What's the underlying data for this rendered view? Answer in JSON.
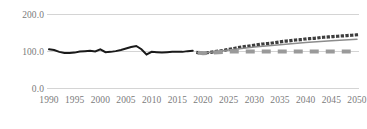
{
  "chart_data": {
    "type": "line",
    "title": "",
    "subtitle": "",
    "xlabel": "",
    "ylabel": "",
    "xlim": [
      1990,
      2050
    ],
    "ylim": [
      0,
      200
    ],
    "grid": true,
    "grid_axis": "y",
    "legend": "none",
    "yticks": [
      "0.0",
      "100.0",
      "200.0"
    ],
    "ytick_values": [
      0,
      100,
      200
    ],
    "xticks": [
      "1990",
      "1995",
      "2000",
      "2005",
      "2010",
      "2015",
      "2020",
      "2025",
      "2030",
      "2035",
      "2040",
      "2045",
      "2050"
    ],
    "xtick_values": [
      1990,
      1995,
      2000,
      2005,
      2010,
      2015,
      2020,
      2025,
      2030,
      2035,
      2040,
      2045,
      2050
    ],
    "series": [
      {
        "name": "historical",
        "style": "solid",
        "color": "#1a1a1a",
        "width": 2.0,
        "x": [
          1990,
          1991,
          1992,
          1993,
          1994,
          1995,
          1996,
          1997,
          1998,
          1999,
          2000,
          2001,
          2002,
          2003,
          2004,
          2005,
          2006,
          2007,
          2008,
          2009,
          2010,
          2011,
          2012,
          2013,
          2014,
          2015,
          2016,
          2017,
          2018
        ],
        "values": [
          106,
          104,
          99,
          96,
          96,
          97,
          100,
          101,
          102,
          100,
          106,
          98,
          99,
          101,
          104,
          108,
          112,
          115,
          106,
          92,
          99,
          98,
          97,
          98,
          99,
          99,
          99,
          101,
          102
        ]
      },
      {
        "name": "projection-high",
        "style": "dotted",
        "color": "#3d3d3d",
        "width": 3.2,
        "x": [
          2019,
          2020,
          2021,
          2022,
          2023,
          2024,
          2025,
          2026,
          2027,
          2028,
          2029,
          2030,
          2031,
          2032,
          2033,
          2034,
          2035,
          2036,
          2037,
          2038,
          2039,
          2040,
          2041,
          2042,
          2043,
          2044,
          2045,
          2046,
          2047,
          2048,
          2049,
          2050
        ],
        "values": [
          97,
          95,
          97,
          99,
          101,
          103,
          106,
          108,
          111,
          113,
          115,
          117,
          119,
          121,
          122,
          124,
          126,
          128,
          129,
          131,
          132,
          134,
          135,
          136,
          138,
          139,
          140,
          141,
          142,
          143,
          144,
          145
        ]
      },
      {
        "name": "projection-medium",
        "style": "solid",
        "color": "#8c8c8c",
        "width": 1.5,
        "x": [
          2019,
          2020,
          2025,
          2030,
          2035,
          2040,
          2045,
          2050
        ],
        "values": [
          97,
          95,
          104,
          112,
          118,
          124,
          129,
          133
        ]
      },
      {
        "name": "projection-flat",
        "style": "dashed",
        "color": "#9a9a9a",
        "width": 4.0,
        "x": [
          2019,
          2020,
          2025,
          2030,
          2035,
          2040,
          2045,
          2050
        ],
        "values": [
          97,
          95,
          100,
          100,
          100,
          100,
          100,
          100
        ]
      }
    ],
    "colors": {
      "historical": "#1a1a1a",
      "projection_high": "#3d3d3d",
      "projection_medium": "#8c8c8c",
      "projection_flat": "#9a9a9a",
      "gridline": "#d4d4d4",
      "tick_label": "#7b7b7b",
      "background": "#ffffff"
    }
  }
}
